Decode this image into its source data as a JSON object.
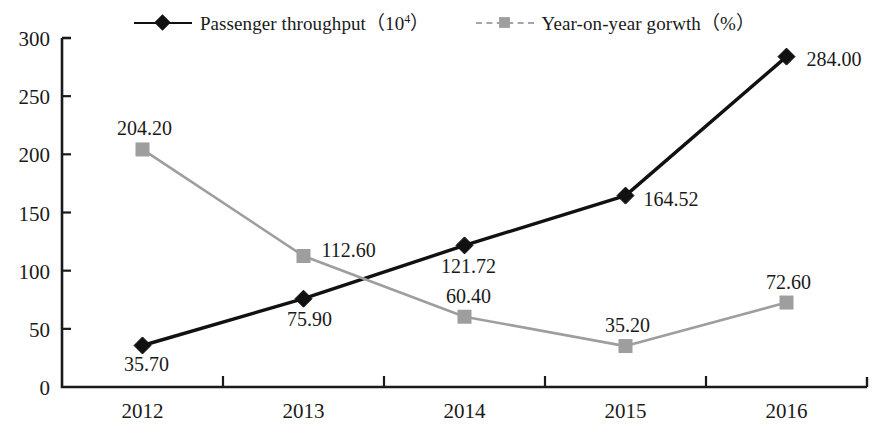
{
  "legend": {
    "position": "top-center",
    "entries": [
      {
        "name": "passenger-throughput",
        "label_main": "Passenger throughput（10",
        "label_sup": "4",
        "label_tail": "）",
        "label_full": "Passenger throughput（10⁴）",
        "marker": "diamond-marker",
        "color": "#111111",
        "linestyle": "solid"
      },
      {
        "name": "year-on-year-growth",
        "label_main": "Year-on-year gorwth（%",
        "label_sup": "",
        "label_tail": "）",
        "label_full": "Year-on-year gorwth（%）",
        "marker": "square-marker",
        "color": "#9e9e9e",
        "linestyle": "dashed"
      }
    ]
  },
  "chart_data": {
    "type": "line",
    "title": "",
    "xlabel": "",
    "ylabel": "",
    "categories": [
      "2012",
      "2013",
      "2014",
      "2015",
      "2016"
    ],
    "ylim": [
      0,
      300
    ],
    "yticks": [
      0,
      50,
      100,
      150,
      200,
      250,
      300
    ],
    "ytick_labels": [
      "0",
      "50",
      "100",
      "150",
      "200",
      "250",
      "300"
    ],
    "grid": false,
    "legend_position": "top-center",
    "series": [
      {
        "name": "Passenger throughput（10⁴）",
        "color": "#111111",
        "marker": "diamond",
        "linestyle": "solid",
        "values": [
          35.7,
          75.9,
          121.72,
          164.52,
          284.0
        ],
        "data_labels": [
          "35.70",
          "75.90",
          "121.72",
          "164.52",
          "284.00"
        ],
        "label_offsets": [
          {
            "dx": 4,
            "dy": 26
          },
          {
            "dx": 6,
            "dy": 27
          },
          {
            "dx": 4,
            "dy": 28
          },
          {
            "dx": 18,
            "dy": 10
          },
          {
            "dx": 20,
            "dy": 9
          }
        ],
        "label_anchor": [
          "middle",
          "middle",
          "middle",
          "start",
          "start"
        ]
      },
      {
        "name": "Year-on-year gorwth（%）",
        "color": "#9e9e9e",
        "marker": "square",
        "linestyle": "solid",
        "values": [
          204.2,
          112.6,
          60.4,
          35.2,
          72.6
        ],
        "data_labels": [
          "204.20",
          "112.60",
          "60.40",
          "35.20",
          "72.60"
        ],
        "label_offsets": [
          {
            "dx": 2,
            "dy": -14
          },
          {
            "dx": 18,
            "dy": 1
          },
          {
            "dx": 4,
            "dy": -14
          },
          {
            "dx": 2,
            "dy": -14
          },
          {
            "dx": 2,
            "dy": -14
          }
        ],
        "label_anchor": [
          "middle",
          "start",
          "middle",
          "middle",
          "middle"
        ]
      }
    ]
  },
  "colors": {
    "axis": "#1a1a1a",
    "series_primary": "#111111",
    "series_secondary": "#9e9e9e",
    "background": "#ffffff"
  }
}
